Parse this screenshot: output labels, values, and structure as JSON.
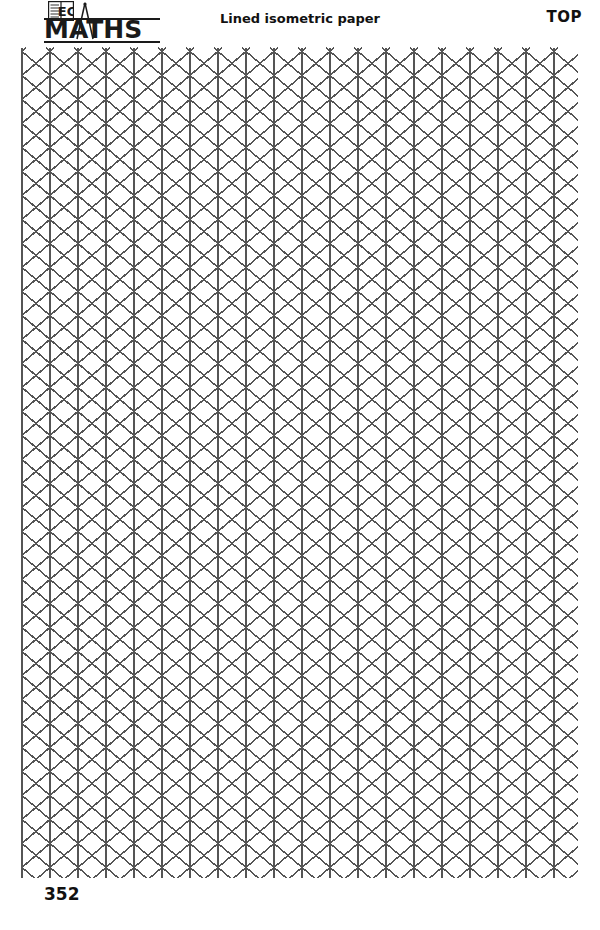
{
  "page": {
    "width": 600,
    "height": 930,
    "background": "#ffffff"
  },
  "header": {
    "title": "Lined isometric paper",
    "corner_label": "TOP",
    "logo": {
      "wordmark": "MATHS",
      "book_icon_text": "EC",
      "book_icon_name": "open-book-icon",
      "compass_icon_name": "compass-dividers-icon"
    }
  },
  "footer": {
    "page_number": "352"
  },
  "grid": {
    "type": "isometric-triangular",
    "line_color": "#555555",
    "line_width": 1.6,
    "left": 22,
    "right": 578,
    "top": 48,
    "bottom": 878,
    "column_spacing": 28,
    "row_spacing": 24,
    "columns": 20,
    "rows": 34
  }
}
